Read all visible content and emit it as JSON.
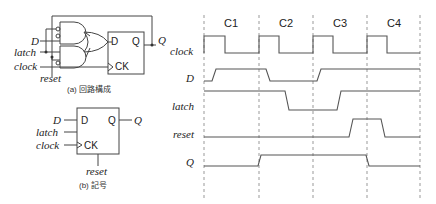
{
  "circuit": {
    "caption": "(a) 回路構成",
    "inputs": [
      "D",
      "latch",
      "clock",
      "reset"
    ],
    "output": "Q",
    "ff_pins": {
      "d": "D",
      "q": "Q",
      "ck": "CK"
    }
  },
  "symbol": {
    "caption": "(b) 記号",
    "inputs": [
      "D",
      "latch",
      "clock",
      "reset"
    ],
    "output": "Q",
    "pins": {
      "d": "D",
      "q": "Q",
      "ck": "CK"
    }
  },
  "timing": {
    "cycles": [
      "C1",
      "C2",
      "C3",
      "C4"
    ],
    "signals": [
      {
        "name": "clock",
        "waveform": "pulse high at start of each cycle"
      },
      {
        "name": "D",
        "waveform": "low→high early C1, high→low early C2, low→high early C3, high through C4"
      },
      {
        "name": "latch",
        "waveform": "high through C1, falls mid C2, rises mid C3, high through C4"
      },
      {
        "name": "reset",
        "waveform": "low, pulse high late C3 to early C4"
      },
      {
        "name": "Q",
        "waveform": "low in C1, rises at C2 edge, falls at C4 edge"
      }
    ]
  }
}
